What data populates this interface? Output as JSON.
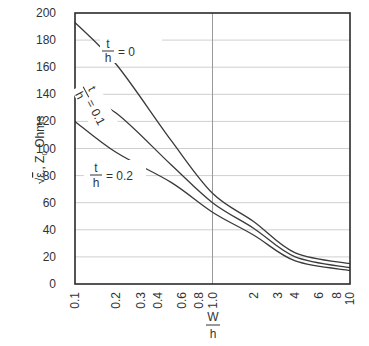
{
  "chart_data": {
    "type": "line",
    "title": "",
    "xlabel": "W/h",
    "xlabel_num": "W",
    "xlabel_den": "h",
    "ylabel": "√εr Z0 Ohms",
    "ylabel_parts": {
      "root": "√",
      "eps": "ε",
      "eps_sub": "r",
      "z": "Z",
      "z_sub": "0",
      "unit": "Ohms"
    },
    "xscale": "log",
    "xlim": [
      0.1,
      10
    ],
    "ylim": [
      0,
      200
    ],
    "grid": true,
    "x_ticks": [
      {
        "value": 0.1,
        "label": "0.1"
      },
      {
        "value": 0.2,
        "label": "0.2"
      },
      {
        "value": 0.3,
        "label": "0.3"
      },
      {
        "value": 0.4,
        "label": "0.4"
      },
      {
        "value": 0.6,
        "label": "0.6"
      },
      {
        "value": 0.8,
        "label": "0.8"
      },
      {
        "value": 1.0,
        "label": "1.0"
      },
      {
        "value": 2,
        "label": "2"
      },
      {
        "value": 3,
        "label": "3"
      },
      {
        "value": 4,
        "label": "4"
      },
      {
        "value": 6,
        "label": "6"
      },
      {
        "value": 8,
        "label": "8"
      },
      {
        "value": 10,
        "label": "10"
      }
    ],
    "y_ticks": [
      0,
      20,
      40,
      60,
      80,
      100,
      120,
      140,
      160,
      180,
      200
    ],
    "x": [
      0.1,
      0.2,
      0.5,
      1.0,
      2,
      4,
      10
    ],
    "series": [
      {
        "name": "t/h = 0",
        "label_num": "t",
        "label_den": "h",
        "label_val": "= 0",
        "values": [
          193,
          162,
          106,
          67,
          46,
          23,
          15
        ]
      },
      {
        "name": "t/h = 0.1",
        "label_num": "t",
        "label_den": "h",
        "label_val": "= 0.1",
        "values": [
          142,
          126,
          88,
          60,
          41,
          20,
          12
        ]
      },
      {
        "name": "t/h = 0.2",
        "label_num": "t",
        "label_den": "h",
        "label_val": "= 0.2",
        "values": [
          120,
          97,
          75,
          53,
          36,
          17,
          10
        ]
      }
    ],
    "colors": {
      "line": "#3a3a3a",
      "axis": "#2a2a2a",
      "grid": "#cfcfcf",
      "text": "#333333"
    }
  }
}
